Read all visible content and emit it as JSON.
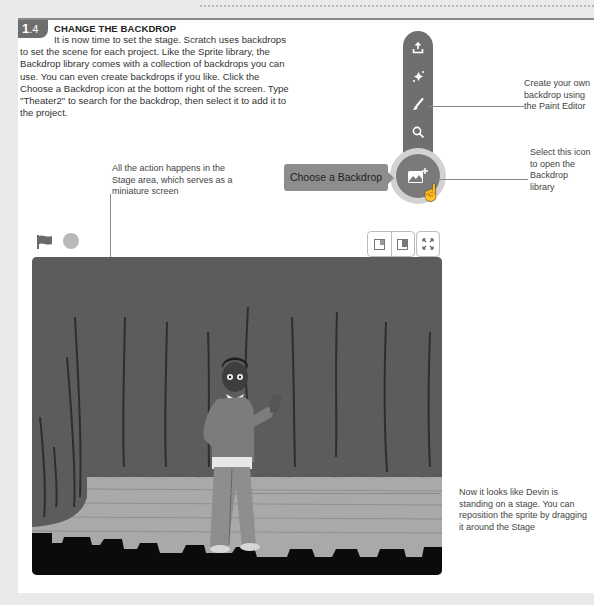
{
  "step": {
    "number": "1",
    "sub": ".4",
    "title": "CHANGE THE BACKDROP",
    "body": "It is now time to set the stage. Scratch uses backdrops to set the scene for each project. Like the Sprite library, the Backdrop library comes with a collection of backdrops you can use. You can even create backdrops if you like. Click the Choose a Backdrop icon at the bottom right of the screen. Type \"Theater2\" to search for the backdrop, then select it to add it to the project."
  },
  "toolbar": {
    "icons": [
      "upload-icon",
      "surprise-icon",
      "paint-icon",
      "search-icon",
      "choose-backdrop-icon"
    ],
    "tooltip": "Choose a Backdrop"
  },
  "callouts": {
    "paint": "Create your own backdrop using the Paint Editor",
    "select": "Select this icon to open the Backdrop library",
    "stage": "All the action happens in the Stage area, which serves as a miniature screen",
    "sprite": "Now it looks like Devin is standing on a stage. You can reposition the sprite by dragging it around the Stage"
  },
  "stage": {
    "backdrop": "Theater2",
    "sprite": "Devin",
    "controls": [
      "green-flag",
      "stop",
      "small-stage",
      "large-stage",
      "fullscreen"
    ]
  },
  "colors": {
    "panel": "#ffffff",
    "page": "#e9e9e9",
    "toolbar": "#6f6f6f",
    "curtain": "#5a5a5a",
    "floor": "#a9a9a9"
  }
}
